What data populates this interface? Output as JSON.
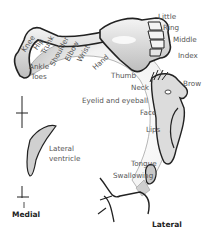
{
  "labels": {
    "knee": "Knee",
    "hip": "Hip",
    "trunk": "Trunk",
    "shoulder": "Shoulder",
    "elbow": "Elbow",
    "wrist": "Wrist",
    "hand": "Hand",
    "little": "Little",
    "ring": "Ring",
    "middle": "Middle",
    "index": "Index",
    "thumb": "Thumb",
    "neck": "Neck",
    "brow": "Brow",
    "eyelid": "Eyelid and eyeball",
    "face": "Face",
    "lips": "Lips",
    "tongue": "Tongue",
    "swallowing": "Swallowing",
    "ankle": "Ankle",
    "toes": "Toes",
    "ventricle_line1": "Lateral",
    "ventricle_line2": "ventricle"
  },
  "orientation": {
    "medial": "Medial",
    "lateral": "Lateral"
  },
  "colors": {
    "outline": "#222222",
    "fill": "#d4d4d4",
    "cortex_fill": "#ececec",
    "text": "#555555"
  }
}
